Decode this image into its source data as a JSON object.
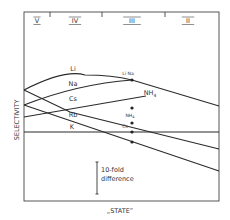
{
  "chart_data": {
    "type": "line",
    "title": "",
    "xlabel": "„STATE”",
    "ylabel": "SELECTIVITY",
    "states": [
      {
        "label": "V",
        "x": 37
      },
      {
        "label": "IV",
        "x": 75
      },
      {
        "label": "III",
        "x": 132
      },
      {
        "label": "II",
        "x": 188
      }
    ],
    "state_dividers_x": [
      50,
      102,
      165
    ],
    "grid": false,
    "series": [
      {
        "name": "Li",
        "points": [
          [
            24,
            90
          ],
          [
            85,
            75
          ],
          [
            132,
            80
          ],
          [
            219,
            106
          ]
        ],
        "label_pos": [
          73,
          71
        ]
      },
      {
        "name": "Na",
        "points": [
          [
            24,
            105
          ],
          [
            132,
            80
          ]
        ],
        "label_pos": [
          73,
          86
        ]
      },
      {
        "name": "Cs",
        "points": [
          [
            24,
            90
          ],
          [
            70,
            112
          ],
          [
            219,
            149
          ]
        ],
        "label_pos": [
          73,
          101
        ]
      },
      {
        "name": "Rb",
        "points": [
          [
            24,
            105
          ],
          [
            219,
            171
          ]
        ],
        "label_pos": [
          73,
          117
        ]
      },
      {
        "name": "NH4",
        "points": [
          [
            24,
            117
          ],
          [
            146,
            96
          ]
        ],
        "label_pos": [
          150,
          95
        ]
      },
      {
        "name": "K",
        "points": [
          [
            24,
            132
          ],
          [
            219,
            132
          ]
        ],
        "label_pos": [
          72,
          129
        ]
      }
    ],
    "markers": [
      {
        "label": "Li Na",
        "x": 132,
        "y": 80,
        "label_x": 128,
        "label_y": 75
      },
      {
        "label": "NH4",
        "x": 132,
        "y": 108,
        "label_x": 130,
        "label_y": 117
      },
      {
        "label": "Cs",
        "x": 132,
        "y": 123,
        "label_x": 125,
        "label_y": 128
      },
      {
        "label": "",
        "x": 132,
        "y": 132
      },
      {
        "label": "",
        "x": 132,
        "y": 142
      }
    ],
    "annotation": {
      "text_line1": "10-fold",
      "text_line2": "difference",
      "bar_x": 97,
      "bar_y1": 162,
      "bar_y2": 194
    }
  }
}
